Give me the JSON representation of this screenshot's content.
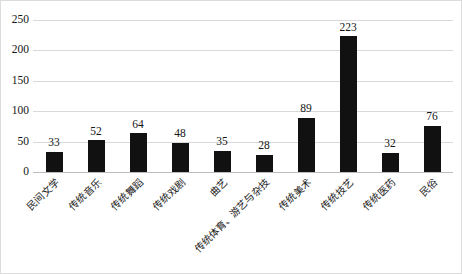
{
  "chart_data": {
    "type": "bar",
    "title": "",
    "subtitle": "",
    "xlabel": "",
    "ylabel": "",
    "categories": [
      "民间文学",
      "传统音乐",
      "传统舞蹈",
      "传统戏剧",
      "曲艺",
      "传统体育、游艺与杂技",
      "传统美术",
      "传统技艺",
      "传统医药",
      "民俗"
    ],
    "values": [
      33,
      52,
      64,
      48,
      35,
      28,
      89,
      223,
      32,
      76
    ],
    "data_labels": [
      "33",
      "52",
      "64",
      "48",
      "35",
      "28",
      "89",
      "223",
      "32",
      "76"
    ],
    "ylim": [
      0,
      250
    ],
    "yticks": [
      0,
      50,
      100,
      150,
      200,
      250
    ],
    "ytick_labels": [
      "0",
      "50",
      "100",
      "150",
      "200",
      "250"
    ],
    "grid": true,
    "legend": false,
    "legend_position": "none",
    "bar_color": "#111111",
    "gridline_color": "#d9d9d9",
    "axis_color": "#bcbcbc",
    "background_color": "#ffffff",
    "label_rotation": -45
  }
}
